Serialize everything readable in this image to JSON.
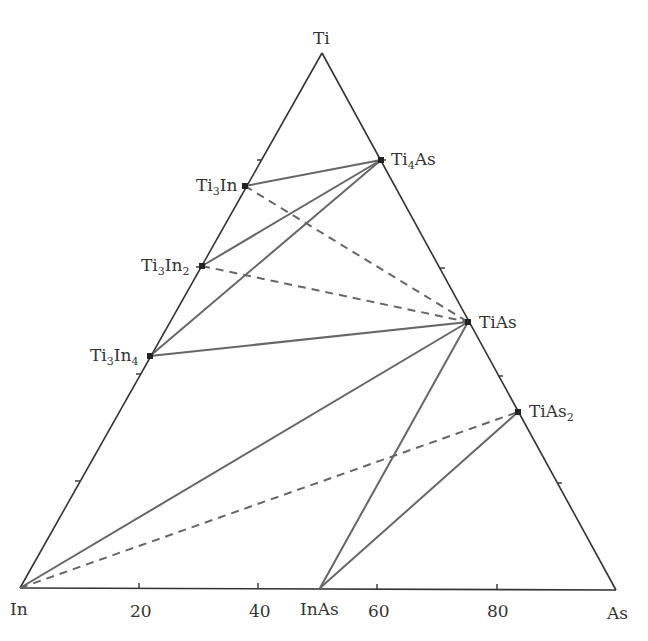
{
  "diagram": {
    "type": "ternary-phase-diagram",
    "system": "In-Ti-As",
    "vertices": {
      "top": {
        "label": "Ti",
        "x": 322,
        "y": 53
      },
      "left": {
        "label": "In",
        "x": 20,
        "y": 588
      },
      "right": {
        "label": "As",
        "x": 616,
        "y": 590
      }
    },
    "axis": {
      "bottom_ticks": [
        "20",
        "40",
        "60",
        "80"
      ],
      "tick_step": 20,
      "unit": "at.%"
    },
    "phases": [
      {
        "id": "Ti4As",
        "base": "Ti",
        "sub": "4",
        "tail": "As",
        "x": 381,
        "y": 160
      },
      {
        "id": "Ti3In",
        "base": "Ti",
        "sub": "3",
        "tail": "In",
        "x": 245,
        "y": 186
      },
      {
        "id": "Ti3In2",
        "base": "Ti",
        "sub": "3",
        "tail": "In",
        "sub2": "2",
        "x": 202,
        "y": 266
      },
      {
        "id": "Ti3In4",
        "base": "Ti",
        "sub": "3",
        "tail": "In",
        "sub2": "4",
        "x": 150,
        "y": 356
      },
      {
        "id": "TiAs",
        "base": "TiAs",
        "x": 468,
        "y": 322
      },
      {
        "id": "TiAs2",
        "base": "TiAs",
        "sub": "2",
        "x": 518,
        "y": 412
      },
      {
        "id": "InAs",
        "base": "InAs",
        "x": 320,
        "y": 588
      }
    ],
    "tie_lines_solid": [
      [
        "Ti3In",
        "Ti4As"
      ],
      [
        "Ti3In2",
        "Ti4As"
      ],
      [
        "Ti3In4",
        "Ti4As"
      ],
      [
        "Ti3In4",
        "TiAs"
      ],
      [
        "In",
        "TiAs"
      ],
      [
        "InAs",
        "TiAs"
      ],
      [
        "InAs",
        "TiAs2"
      ]
    ],
    "tie_lines_dashed": [
      [
        "Ti3In",
        "TiAs"
      ],
      [
        "Ti3In2",
        "TiAs"
      ],
      [
        "In",
        "TiAs2"
      ]
    ],
    "colors": {
      "edge": "#333333",
      "tie_line": "#666666",
      "point": "#222222"
    }
  }
}
